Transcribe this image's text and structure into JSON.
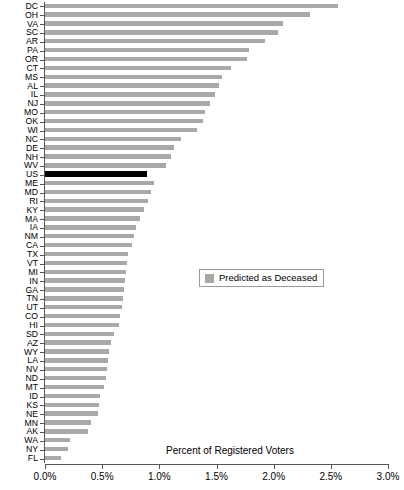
{
  "chart_data": {
    "type": "bar",
    "orientation": "horizontal",
    "title": "",
    "xlabel": "Percent of Registered Voters",
    "ylabel": "",
    "xlim": [
      0.0,
      3.0
    ],
    "xticks": [
      0.0,
      0.5,
      1.0,
      1.5,
      2.0,
      2.5,
      3.0
    ],
    "xtick_labels": [
      "0.0%",
      "0.5%",
      "1.0%",
      "1.5%",
      "2.0%",
      "2.5%",
      "3.0%"
    ],
    "grid": false,
    "legend": {
      "position": "center-right",
      "entries": [
        {
          "label": "Predicted as Deceased",
          "color": "#a9a9a9"
        }
      ]
    },
    "highlight": {
      "category": "US",
      "color": "#000000"
    },
    "bar_color": "#a9a9a9",
    "categories": [
      "DC",
      "OH",
      "VA",
      "SC",
      "AR",
      "PA",
      "OR",
      "CT",
      "MS",
      "AL",
      "IL",
      "NJ",
      "MO",
      "OK",
      "WI",
      "NC",
      "DE",
      "NH",
      "WV",
      "US",
      "ME",
      "MD",
      "RI",
      "KY",
      "MA",
      "IA",
      "NM",
      "CA",
      "TX",
      "VT",
      "MI",
      "IN",
      "GA",
      "TN",
      "UT",
      "CO",
      "HI",
      "SD",
      "AZ",
      "WY",
      "LA",
      "NV",
      "ND",
      "MT",
      "ID",
      "KS",
      "NE",
      "MN",
      "AK",
      "WA",
      "NY",
      "FL"
    ],
    "values": [
      2.56,
      2.32,
      2.08,
      2.04,
      1.92,
      1.78,
      1.77,
      1.63,
      1.55,
      1.52,
      1.49,
      1.44,
      1.4,
      1.38,
      1.33,
      1.19,
      1.13,
      1.1,
      1.06,
      0.89,
      0.95,
      0.93,
      0.9,
      0.87,
      0.83,
      0.8,
      0.78,
      0.76,
      0.73,
      0.72,
      0.71,
      0.7,
      0.69,
      0.68,
      0.67,
      0.66,
      0.65,
      0.6,
      0.58,
      0.56,
      0.55,
      0.54,
      0.53,
      0.52,
      0.48,
      0.47,
      0.46,
      0.4,
      0.38,
      0.22,
      0.2,
      0.14
    ]
  }
}
